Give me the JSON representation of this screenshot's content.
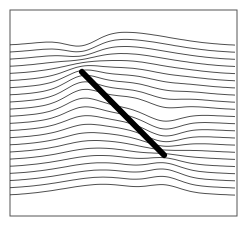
{
  "diagram": {
    "type": "streamline-plot",
    "frame": {
      "x": 10,
      "y": 10,
      "width": 227,
      "height": 206,
      "stroke": "#555555"
    },
    "plate": {
      "x1": 82,
      "y1": 72,
      "x2": 164,
      "y2": 155,
      "color": "#000000"
    },
    "streamline_color": "#222222",
    "streamline_count": 22
  }
}
